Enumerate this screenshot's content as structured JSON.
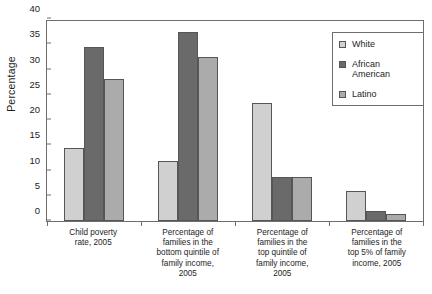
{
  "chart_data": {
    "type": "bar",
    "title": "",
    "xlabel": "",
    "ylabel": "Percentage",
    "ylim": [
      0,
      40
    ],
    "ytick_step": 5,
    "yticks": [
      0,
      5,
      10,
      15,
      20,
      25,
      30,
      35,
      40
    ],
    "grid": false,
    "legend_position": "top-right",
    "categories": [
      "Child poverty rate, 2005",
      "Percentage of families in the bottom quintile of family income, 2005",
      "Percentage of families in the top quintile of family income, 2005",
      "Percentage of families in the top 5% of family income, 2005"
    ],
    "category_lines": [
      [
        "Child poverty",
        "rate, 2005"
      ],
      [
        "Percentage of",
        "families in the",
        "bottom quintile of",
        "family income,",
        "2005"
      ],
      [
        "Percentage of",
        "families in the",
        "top quintile of",
        "family income,",
        "2005"
      ],
      [
        "Percentage of",
        "families in the",
        "top 5% of family",
        "income, 2005"
      ]
    ],
    "series": [
      {
        "name": "White",
        "color": "#d0d0d0",
        "values": [
          14.5,
          11.8,
          23.3,
          5.9
        ]
      },
      {
        "name": "African American",
        "color": "#6a6a6a",
        "values": [
          34.5,
          37.4,
          8.8,
          2.0
        ]
      },
      {
        "name": "Latino",
        "color": "#ababab",
        "values": [
          28.1,
          32.4,
          8.8,
          1.3
        ]
      }
    ],
    "legend_lines": [
      [
        "White"
      ],
      [
        "African",
        "American"
      ],
      [
        "Latino"
      ]
    ]
  }
}
